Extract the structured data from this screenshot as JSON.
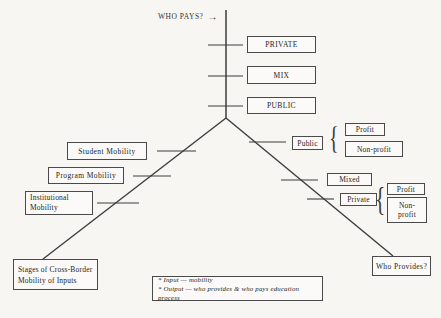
{
  "header": {
    "title": "WHO PAYS?",
    "arrow": "→"
  },
  "pay_levels": [
    {
      "label": "PRIVATE"
    },
    {
      "label": "MIX"
    },
    {
      "label": "PUBLIC"
    }
  ],
  "mobility_items": [
    {
      "label": "Student Mobility"
    },
    {
      "label": "Program Mobility"
    },
    {
      "label": "Institutional Mobility"
    }
  ],
  "providers": {
    "public_group": {
      "label": "Public",
      "brace": "{",
      "profit": "Profit",
      "non_profit": "Non-profit"
    },
    "mixed": {
      "label": "Mixed"
    },
    "private_group": {
      "label": "Private",
      "brace": "{",
      "profit": "Profit",
      "non_profit": "Non-profit"
    }
  },
  "bottom_left": {
    "label": "Stages of Cross-Border Mobility of Inputs"
  },
  "bottom_right": {
    "label": "Who Provides?"
  },
  "legend": {
    "lines": [
      "* Input — mobility",
      "* Output — who provides & who pays education process"
    ]
  },
  "colors": {
    "background": "#f7f6f3",
    "line": "#3d3d3d",
    "border": "#4a4a4a",
    "text": "#242424"
  }
}
